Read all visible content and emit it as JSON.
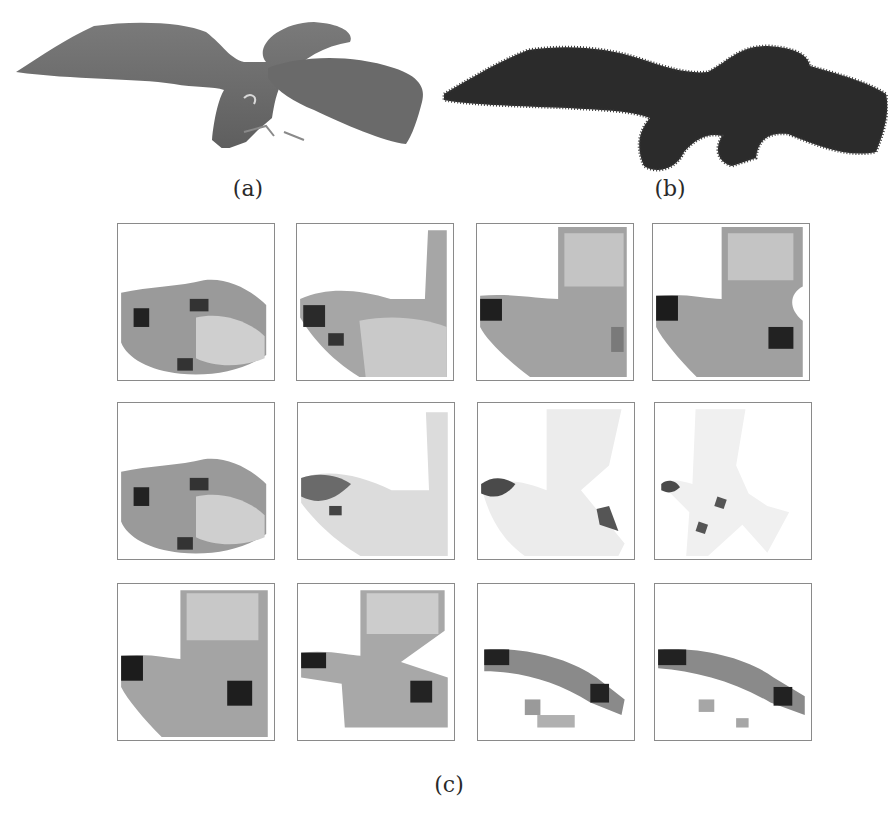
{
  "figure": {
    "subfigures": [
      {
        "id": "a",
        "label": "(a)",
        "description": "smooth shaded 3D eagle mesh"
      },
      {
        "id": "b",
        "label": "(b)",
        "description": "eagle point cloud with normals"
      },
      {
        "id": "c",
        "label": "(c)",
        "description": "grid of 12 density renderings (3 rows x 4 columns)"
      }
    ],
    "grid": {
      "rows": 3,
      "cols": 4,
      "panels": [
        {
          "row": 1,
          "col": 1,
          "kind": "voxel-side"
        },
        {
          "row": 1,
          "col": 2,
          "kind": "voxel-side-wing"
        },
        {
          "row": 1,
          "col": 3,
          "kind": "voxel-wing"
        },
        {
          "row": 1,
          "col": 4,
          "kind": "voxel-wing-dark"
        },
        {
          "row": 2,
          "col": 1,
          "kind": "voxel-side"
        },
        {
          "row": 2,
          "col": 2,
          "kind": "points-side-wing"
        },
        {
          "row": 2,
          "col": 3,
          "kind": "points-bird"
        },
        {
          "row": 2,
          "col": 4,
          "kind": "points-bird-small"
        },
        {
          "row": 3,
          "col": 1,
          "kind": "voxel-wing-dark"
        },
        {
          "row": 3,
          "col": 2,
          "kind": "voxel-cross"
        },
        {
          "row": 3,
          "col": 3,
          "kind": "voxel-arc"
        },
        {
          "row": 3,
          "col": 4,
          "kind": "voxel-arc-sparse"
        }
      ]
    },
    "colors": {
      "mesh": "#6e6e6e",
      "pointcloud": "#2b2b2b",
      "panel_border": "#8a8a8a"
    }
  }
}
